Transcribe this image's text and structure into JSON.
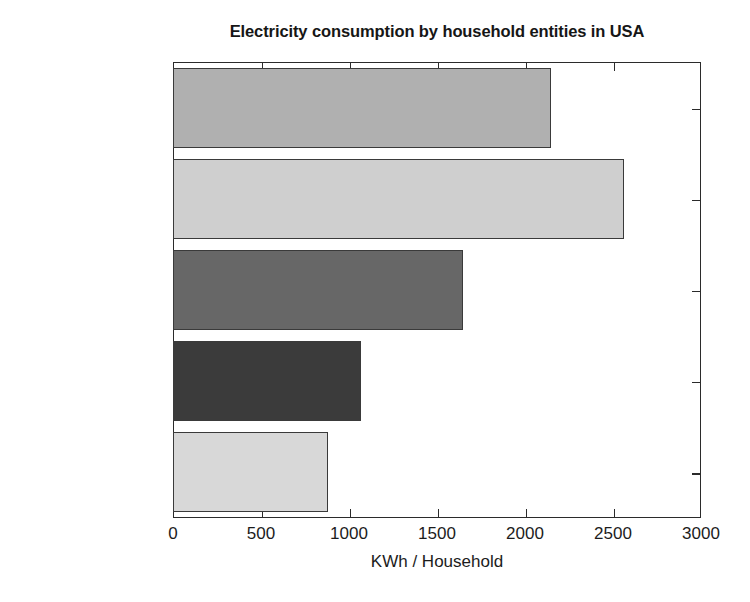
{
  "chart_data": {
    "type": "bar",
    "orientation": "horizontal",
    "title": "Electricity consumption by household entities in USA",
    "xlabel": "KWh / Household",
    "ylabel": "",
    "categories": [
      "Refrigeration",
      "Water Heating",
      "Lighting",
      "Air Conditioning",
      "Other"
    ],
    "values": [
      880,
      1070,
      1650,
      2560,
      2150
    ],
    "bar_colors": [
      "#d8d8d8",
      "#3b3b3b",
      "#676767",
      "#cfcfcf",
      "#b0b0b0"
    ],
    "xlim": [
      0,
      3000
    ],
    "xticks": [
      0,
      500,
      1000,
      1500,
      2000,
      2500,
      3000
    ],
    "xticklabels": [
      "0",
      "500",
      "1000",
      "1500",
      "2000",
      "2500",
      "3000"
    ],
    "grid": false,
    "legend": null,
    "edge_color": "#3a3a3a",
    "axes_color": "#2b2b2b",
    "background": "#ffffff"
  }
}
